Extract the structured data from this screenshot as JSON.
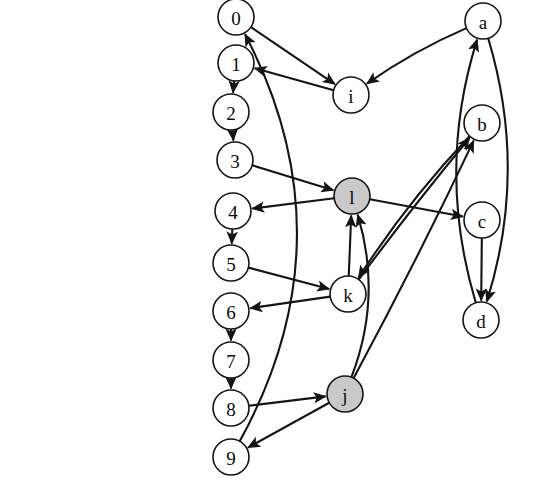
{
  "diagram": {
    "type": "directed-graph",
    "background_color": "#ffffff",
    "node_stroke_color": "#141414",
    "edge_color": "#141414",
    "shaded_fill": "#c9c9c9",
    "plain_fill": "#ffffff",
    "nodes": [
      {
        "id": "0",
        "label": "0",
        "x": 236,
        "y": 17,
        "r": 18,
        "shaded": false
      },
      {
        "id": "1",
        "label": "1",
        "x": 236,
        "y": 63,
        "r": 18,
        "shaded": false
      },
      {
        "id": "2",
        "label": "2",
        "x": 231,
        "y": 112,
        "r": 18,
        "shaded": false
      },
      {
        "id": "3",
        "label": "3",
        "x": 235,
        "y": 160,
        "r": 18,
        "shaded": false
      },
      {
        "id": "4",
        "label": "4",
        "x": 233,
        "y": 211,
        "r": 18,
        "shaded": false
      },
      {
        "id": "5",
        "label": "5",
        "x": 231,
        "y": 263,
        "r": 18,
        "shaded": false
      },
      {
        "id": "6",
        "label": "6",
        "x": 231,
        "y": 311,
        "r": 18,
        "shaded": false
      },
      {
        "id": "7",
        "label": "7",
        "x": 231,
        "y": 360,
        "r": 18,
        "shaded": false
      },
      {
        "id": "8",
        "label": "8",
        "x": 231,
        "y": 408,
        "r": 18,
        "shaded": false
      },
      {
        "id": "9",
        "label": "9",
        "x": 231,
        "y": 457,
        "r": 18,
        "shaded": false
      },
      {
        "id": "i",
        "label": "i",
        "x": 351,
        "y": 95,
        "r": 18,
        "shaded": false
      },
      {
        "id": "l",
        "label": "l",
        "x": 352,
        "y": 196,
        "r": 18,
        "shaded": true
      },
      {
        "id": "k",
        "label": "k",
        "x": 348,
        "y": 294,
        "r": 18,
        "shaded": false
      },
      {
        "id": "j",
        "label": "j",
        "x": 345,
        "y": 394,
        "r": 18,
        "shaded": true
      },
      {
        "id": "a",
        "label": "a",
        "x": 483,
        "y": 21,
        "r": 18,
        "shaded": false
      },
      {
        "id": "b",
        "label": "b",
        "x": 482,
        "y": 123,
        "r": 18,
        "shaded": false
      },
      {
        "id": "c",
        "label": "c",
        "x": 482,
        "y": 220,
        "r": 18,
        "shaded": false
      },
      {
        "id": "d",
        "label": "d",
        "x": 481,
        "y": 320,
        "r": 18,
        "shaded": false
      }
    ],
    "edges": [
      {
        "from": "0",
        "to": "i"
      },
      {
        "from": "i",
        "to": "1"
      },
      {
        "from": "1",
        "to": "2"
      },
      {
        "from": "2",
        "to": "3"
      },
      {
        "from": "3",
        "to": "l"
      },
      {
        "from": "l",
        "to": "4"
      },
      {
        "from": "4",
        "to": "5"
      },
      {
        "from": "5",
        "to": "k"
      },
      {
        "from": "k",
        "to": "6"
      },
      {
        "from": "6",
        "to": "7"
      },
      {
        "from": "7",
        "to": "8"
      },
      {
        "from": "8",
        "to": "j"
      },
      {
        "from": "j",
        "to": "9"
      },
      {
        "from": "9",
        "to": "0"
      },
      {
        "from": "a",
        "to": "i"
      },
      {
        "from": "a",
        "to": "d"
      },
      {
        "from": "d",
        "to": "a"
      },
      {
        "from": "c",
        "to": "d"
      },
      {
        "from": "l",
        "to": "c"
      },
      {
        "from": "k",
        "to": "l"
      },
      {
        "from": "k",
        "to": "b"
      },
      {
        "from": "b",
        "to": "k"
      },
      {
        "from": "j",
        "to": "b"
      },
      {
        "from": "j",
        "to": "l"
      }
    ]
  }
}
